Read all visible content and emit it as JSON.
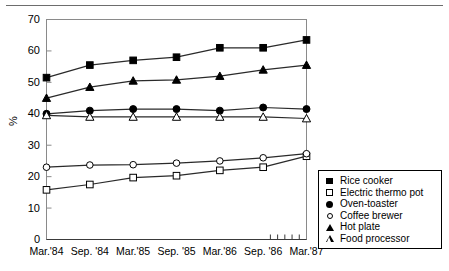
{
  "chart_data": {
    "type": "line",
    "title": "",
    "subtitle": "",
    "xlabel": "",
    "ylabel": "%",
    "ylim": [
      0,
      70
    ],
    "yticks": [
      0,
      10,
      20,
      30,
      40,
      50,
      60,
      70
    ],
    "grid": false,
    "legend_position": "outside-right-bottom",
    "categories": [
      "Mar.'84",
      "Sep. '84",
      "Mar.'85",
      "Sep. '85",
      "Mar.'86",
      "Sep. '86",
      "Mar.'87"
    ],
    "minor_xticks_count": 5,
    "series": [
      {
        "name": "Rice cooker",
        "marker": "filled-square",
        "values": [
          51.5,
          55.5,
          57.0,
          58.0,
          61.0,
          61.0,
          63.5
        ]
      },
      {
        "name": "Electric thermo pot",
        "marker": "open-square",
        "values": [
          15.8,
          17.5,
          19.7,
          20.3,
          22.0,
          23.0,
          26.5
        ]
      },
      {
        "name": "Oven-toaster",
        "marker": "filled-circle",
        "values": [
          40.0,
          41.0,
          41.5,
          41.5,
          41.0,
          42.0,
          41.5
        ]
      },
      {
        "name": "Coffee brewer",
        "marker": "open-circle",
        "values": [
          23.0,
          23.7,
          23.8,
          24.3,
          25.0,
          26.0,
          27.3
        ]
      },
      {
        "name": "Hot plate",
        "marker": "filled-triangle",
        "values": [
          45.0,
          48.5,
          50.5,
          50.8,
          52.0,
          54.0,
          55.5
        ]
      },
      {
        "name": "Food processor",
        "marker": "open-triangle",
        "values": [
          39.5,
          39.0,
          39.0,
          39.0,
          39.0,
          39.0,
          38.5
        ]
      }
    ],
    "colors": {
      "line": "#000000",
      "axis": "#8a8a8a",
      "baseline": "#3a3a3a",
      "background": "#ffffff"
    }
  },
  "legend": {
    "items": [
      {
        "label": "Rice cooker",
        "marker": "filled-square"
      },
      {
        "label": "Electric thermo pot",
        "marker": "open-square"
      },
      {
        "label": "Oven-toaster",
        "marker": "filled-circle"
      },
      {
        "label": "Coffee brewer",
        "marker": "open-circle"
      },
      {
        "label": "Hot plate",
        "marker": "filled-triangle"
      },
      {
        "label": "Food processor",
        "marker": "open-triangle"
      }
    ]
  }
}
